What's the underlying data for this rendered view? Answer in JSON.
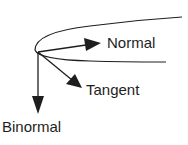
{
  "diagram": {
    "colors": {
      "stroke": "#1e1e1e",
      "background": "#ffffff"
    },
    "labels": {
      "normal": "Normal",
      "tangent": "Tangent",
      "binormal": "Binormal"
    },
    "vectors": [
      {
        "name": "normal",
        "from": [
          38,
          52
        ],
        "to": [
          101,
          43
        ],
        "direction": "right-up"
      },
      {
        "name": "tangent",
        "from": [
          38,
          52
        ],
        "to": [
          82,
          88
        ],
        "direction": "right-down"
      },
      {
        "name": "binormal",
        "from": [
          38,
          52
        ],
        "to": [
          38,
          114
        ],
        "direction": "down"
      }
    ],
    "curves": [
      {
        "name": "upper-curve-branch",
        "from": [
          35,
          50
        ],
        "to": [
          182,
          17
        ]
      },
      {
        "name": "lower-curve-branch",
        "from": [
          35,
          50
        ],
        "to": [
          166,
          62
        ]
      }
    ]
  }
}
